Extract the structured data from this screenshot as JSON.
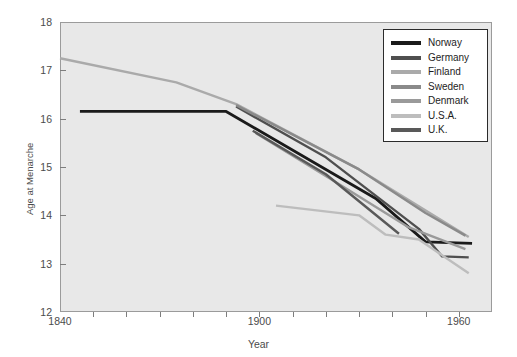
{
  "chart_data": {
    "type": "line",
    "title": "",
    "xlabel": "Year",
    "ylabel": "Age at Menarche",
    "xlim": [
      1840,
      1970
    ],
    "ylim": [
      12,
      18
    ],
    "xticks": [
      1840,
      1900,
      1960
    ],
    "xtick_labels": [
      "1840",
      "1900",
      "1960"
    ],
    "xminor_step": 10,
    "yticks": [
      12,
      13,
      14,
      15,
      16,
      17,
      18
    ],
    "ytick_labels": [
      "12",
      "13",
      "14",
      "15",
      "16",
      "17",
      "18"
    ],
    "grid": false,
    "legend_position": "upper right",
    "plot_background": "#e8e8e8",
    "series": [
      {
        "name": "Norway",
        "color": "#1a1a1a",
        "x": [
          1846,
          1890,
          1935,
          1950,
          1964
        ],
        "y": [
          16.15,
          16.15,
          14.35,
          13.45,
          13.42
        ]
      },
      {
        "name": "Germany",
        "color": "#4f4f4f",
        "x": [
          1893,
          1920,
          1948,
          1955,
          1963
        ],
        "y": [
          16.25,
          15.2,
          13.72,
          13.15,
          13.13
        ]
      },
      {
        "name": "Finland",
        "color": "#aaaaaa",
        "x": [
          1840,
          1875,
          1893,
          1930,
          1963
        ],
        "y": [
          17.25,
          16.75,
          16.3,
          14.95,
          13.55
        ]
      },
      {
        "name": "Sweden",
        "color": "#8a8a8a",
        "x": [
          1893,
          1930,
          1950,
          1962
        ],
        "y": [
          16.28,
          14.95,
          14.05,
          13.58
        ]
      },
      {
        "name": "Denmark",
        "color": "#9a9a9a",
        "x": [
          1899,
          1925,
          1945,
          1962
        ],
        "y": [
          15.7,
          14.6,
          13.75,
          13.3
        ]
      },
      {
        "name": "U.S.A.",
        "color": "#bdbdbd",
        "x": [
          1905,
          1930,
          1938,
          1948,
          1963
        ],
        "y": [
          14.2,
          14.0,
          13.6,
          13.5,
          12.8
        ]
      },
      {
        "name": "U.K.",
        "color": "#595959",
        "x": [
          1898,
          1920,
          1942
        ],
        "y": [
          15.75,
          14.85,
          13.62
        ]
      }
    ]
  }
}
